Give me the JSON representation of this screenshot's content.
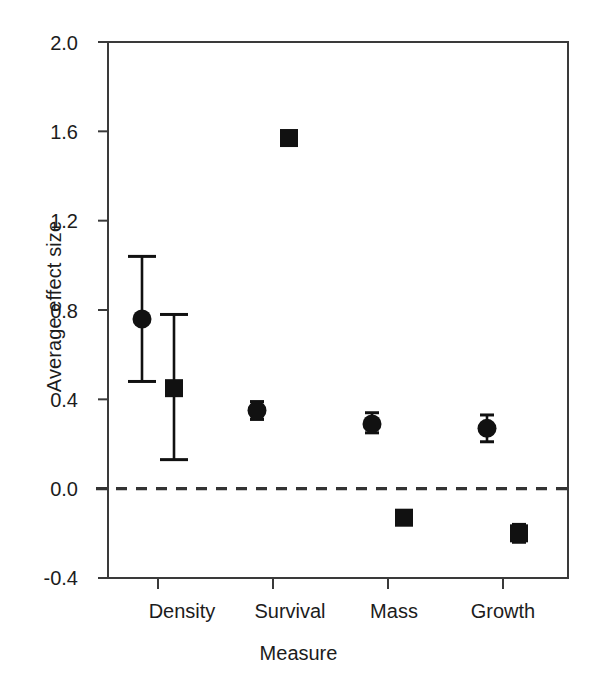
{
  "chart_data": {
    "type": "scatter",
    "title": "",
    "xlabel": "Measure",
    "ylabel": "Average effect size",
    "categories": [
      "Density",
      "Survival",
      "Mass",
      "Growth"
    ],
    "ylim": [
      -0.4,
      2.0
    ],
    "yticks": [
      "2.0",
      "1.6",
      "1.2",
      "0.8",
      "0.4",
      "0.0",
      "-0.4"
    ],
    "ytick_values": [
      2.0,
      1.6,
      1.2,
      0.8,
      0.4,
      0.0,
      -0.4
    ],
    "grid": false,
    "legend": "none",
    "reference_line": {
      "y": 0.0,
      "style": "dashed"
    },
    "series": [
      {
        "name": "circle",
        "marker": "circle",
        "points": [
          {
            "category": "Density",
            "value": 0.76,
            "ci_low": 0.48,
            "ci_high": 1.04
          },
          {
            "category": "Survival",
            "value": 0.35,
            "ci_low": 0.31,
            "ci_high": 0.39
          },
          {
            "category": "Mass",
            "value": 0.29,
            "ci_low": 0.25,
            "ci_high": 0.34
          },
          {
            "category": "Growth",
            "value": 0.27,
            "ci_low": 0.21,
            "ci_high": 0.33
          }
        ]
      },
      {
        "name": "square",
        "marker": "square",
        "points": [
          {
            "category": "Density",
            "value": 0.45,
            "ci_low": 0.13,
            "ci_high": 0.78
          },
          {
            "category": "Survival",
            "value": 1.57,
            "ci_low": 1.57,
            "ci_high": 1.57
          },
          {
            "category": "Mass",
            "value": -0.13,
            "ci_low": -0.13,
            "ci_high": -0.13
          },
          {
            "category": "Growth",
            "value": -0.2,
            "ci_low": -0.24,
            "ci_high": -0.16
          }
        ]
      }
    ],
    "colors": {
      "marker": "#111111",
      "axis": "#3a3a3a",
      "reference_line": "#333333"
    }
  },
  "axis": {
    "y_label": "Average effect size",
    "x_label": "Measure",
    "y_ticks": [
      "2.0",
      "1.6",
      "1.2",
      "0.8",
      "0.4",
      "0.0",
      "-0.4"
    ],
    "x_ticks": [
      "Density",
      "Survival",
      "Mass",
      "Growth"
    ]
  }
}
